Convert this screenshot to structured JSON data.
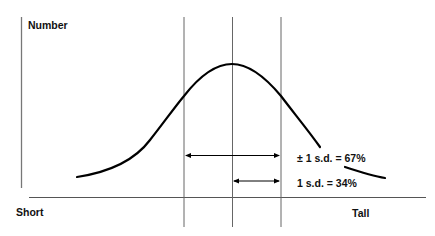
{
  "diagram": {
    "y_axis_label": "Number",
    "x_axis_left_label": "Short",
    "x_axis_right_label": "Tall",
    "annotations": [
      {
        "text": "± 1 s.d. = 67%",
        "meaning": "range within one standard deviation either side of mean"
      },
      {
        "text": "1 s.d. = 34%",
        "meaning": "range from mean to one standard deviation"
      }
    ],
    "vertical_lines": [
      "-1 s.d.",
      "mean",
      "+1 s.d."
    ],
    "colors": {
      "curve": "#000000",
      "lines": "#555555",
      "text": "#111111"
    }
  }
}
